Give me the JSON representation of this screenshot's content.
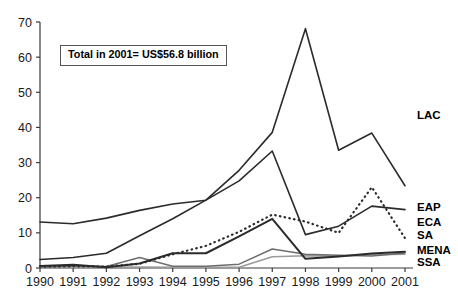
{
  "annotation": {
    "text": "Total in 2001= US$56.8 billion"
  },
  "chart_data": {
    "type": "line",
    "title": "",
    "subtitle": "",
    "xlabel": "",
    "ylabel": "",
    "categories": [
      "1990",
      "1991",
      "1992",
      "1993",
      "1994",
      "1995",
      "1996",
      "1997",
      "1998",
      "1999",
      "2000",
      "2001"
    ],
    "x": [
      1990,
      1991,
      1992,
      1993,
      1994,
      1995,
      1996,
      1997,
      1998,
      1999,
      2000,
      2001
    ],
    "xlim": [
      1990,
      2001
    ],
    "ylim": [
      0,
      70
    ],
    "yticks": [
      0,
      10,
      20,
      30,
      40,
      50,
      60,
      70
    ],
    "ytick_labels": [
      "0",
      "10",
      "20",
      "30",
      "40",
      "50",
      "60",
      "70"
    ],
    "grid": false,
    "legend_position": "right-inline",
    "annotations": [
      "Total in 2001= US$56.8 billion"
    ],
    "series": [
      {
        "name": "LAC",
        "label": "LAC",
        "style": "solid",
        "color": "#2b2b2b",
        "width": 1.6,
        "values": [
          13.1,
          12.6,
          14.2,
          16.4,
          18.2,
          19.3,
          27.8,
          38.6,
          68.1,
          33.5,
          38.4,
          23.4
        ],
        "label_value": 43.5
      },
      {
        "name": "EAP",
        "label": "EAP",
        "style": "solid",
        "color": "#2b2b2b",
        "width": 1.6,
        "values": [
          2.4,
          3.0,
          4.2,
          9.2,
          14.0,
          19.3,
          24.8,
          33.3,
          9.5,
          11.9,
          17.6,
          16.6
        ],
        "label_value": 17.3
      },
      {
        "name": "ECA",
        "label": "ECA",
        "style": "solid",
        "color": "#2b2b2b",
        "width": 2.0,
        "values": [
          0.6,
          0.9,
          0.2,
          1.3,
          4.2,
          4.2,
          9.0,
          14.0,
          2.6,
          3.3,
          4.1,
          4.6
        ],
        "label_value": 13.0
      },
      {
        "name": "SA",
        "label": "SA",
        "style": "dotted",
        "color": "#2b2b2b",
        "width": 2.2,
        "values": [
          0.4,
          0.5,
          0.4,
          1.2,
          3.9,
          6.3,
          10.3,
          15.2,
          13.2,
          10.0,
          23.0,
          8.5
        ],
        "label_value": 9.3
      },
      {
        "name": "MENA",
        "label": "MENA",
        "style": "solid",
        "color": "#6e6e6e",
        "width": 1.5,
        "values": [
          0.3,
          0.6,
          0.4,
          3.0,
          0.5,
          0.5,
          1.1,
          5.4,
          3.9,
          3.6,
          3.4,
          4.3
        ],
        "label_value": 5.2
      },
      {
        "name": "SSA",
        "label": "SSA",
        "style": "solid",
        "color": "#9a9a9a",
        "width": 1.5,
        "values": [
          0.2,
          0.3,
          0.2,
          0.3,
          0.2,
          0.2,
          0.2,
          3.2,
          3.5,
          3.4,
          3.8,
          3.9
        ],
        "label_value": 1.6
      }
    ]
  }
}
